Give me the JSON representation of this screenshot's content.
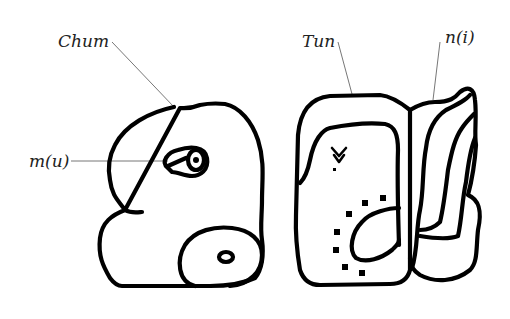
{
  "diagram": {
    "labels": [
      {
        "id": "chum",
        "text": "Chum"
      },
      {
        "id": "mu",
        "text": "m(u)"
      },
      {
        "id": "tun",
        "text": "Tun"
      },
      {
        "id": "ni",
        "text": "n(i)"
      }
    ],
    "colors": {
      "ink": "#000000",
      "leader": "#777777",
      "background": "#ffffff"
    }
  }
}
